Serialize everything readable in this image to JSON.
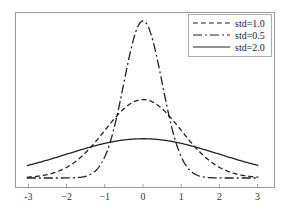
{
  "chart_data": {
    "type": "line",
    "title": "",
    "xlabel": "",
    "ylabel": "",
    "xlim": [
      -3.1,
      3.1
    ],
    "ylim": [
      0,
      0.8
    ],
    "grid": false,
    "legend_position": "upper right",
    "xticks": [
      "-3",
      "-2",
      "-1",
      "0",
      "1",
      "2",
      "3"
    ],
    "yticks": [],
    "series": [
      {
        "name": "std=1.0",
        "mean": 0,
        "std": 1.0,
        "style": "dashed",
        "color": "#222222"
      },
      {
        "name": "std=0.5",
        "mean": 0,
        "std": 0.5,
        "style": "dashdot",
        "color": "#222222"
      },
      {
        "name": "std=2.0",
        "mean": 0,
        "std": 2.0,
        "style": "solid",
        "color": "#222222"
      }
    ],
    "x": [
      -3,
      -2,
      -1,
      0,
      1,
      2,
      3
    ],
    "values_by_series": {
      "std=1.0": [
        0.0044,
        0.054,
        0.242,
        0.399,
        0.242,
        0.054,
        0.0044
      ],
      "std=0.5": [
        0.0,
        0.0003,
        0.108,
        0.798,
        0.108,
        0.0003,
        0.0
      ],
      "std=2.0": [
        0.065,
        0.121,
        0.176,
        0.199,
        0.176,
        0.121,
        0.065
      ]
    }
  },
  "legend": {
    "items": [
      {
        "label": "std=1.0",
        "dash": "5,3"
      },
      {
        "label": "std=0.5",
        "dash": "9,3,2,3"
      },
      {
        "label": "std=2.0",
        "dash": ""
      }
    ]
  },
  "axis": {
    "xticks": [
      {
        "label": "-3",
        "v": -3
      },
      {
        "label": "−2",
        "v": -2
      },
      {
        "label": "−1",
        "v": -1
      },
      {
        "label": "0",
        "v": 0
      },
      {
        "label": "1",
        "v": 1
      },
      {
        "label": "2",
        "v": 2
      },
      {
        "label": "3",
        "v": 3
      }
    ]
  }
}
